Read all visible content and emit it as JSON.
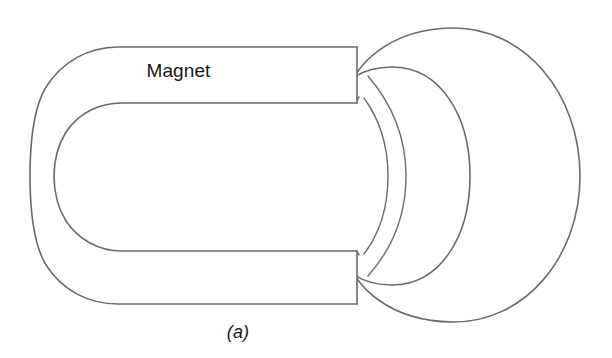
{
  "figure": {
    "kind": "line-diagram",
    "background_color": "#ffffff",
    "stroke_color": "#6a6a6a",
    "labels": {
      "magnet": "Magnet",
      "caption": "(a)"
    },
    "parts": [
      {
        "id": "magnet-body",
        "name": "U-shaped magnet",
        "label": "Magnet",
        "description": "Horseshoe magnet drawn as an open rounded rectangle with two horizontal arms ending in vertical pole faces on the right."
      },
      {
        "id": "torus-ring",
        "name": "Toroidal ring",
        "label": "",
        "description": "Donut-shaped ring seen in perspective, threaded between the two magnet poles."
      }
    ],
    "geometry": {
      "magnet_outer": {
        "left_x": 30,
        "top_y": 47,
        "bottom_y": 304,
        "right_x": 357,
        "corner_radius": 86
      },
      "magnet_inner": {
        "left_x": 88,
        "top_y": 103,
        "bottom_y": 251,
        "right_x": 357,
        "corner_radius": 62
      },
      "torus_outer_circle": {
        "left_x": 345,
        "right_x": 580,
        "top_y": 28,
        "bottom_y": 322,
        "center_x": 462,
        "center_y": 175,
        "radius_x": 118,
        "radius_y": 147
      },
      "torus_mid_ring": {
        "center_x": 400,
        "center_y": 175,
        "radius_x": 70,
        "radius_y": 120
      },
      "torus_hole": {
        "center_x": 355,
        "center_y": 175,
        "radius_x": 32,
        "radius_y": 85
      }
    }
  }
}
